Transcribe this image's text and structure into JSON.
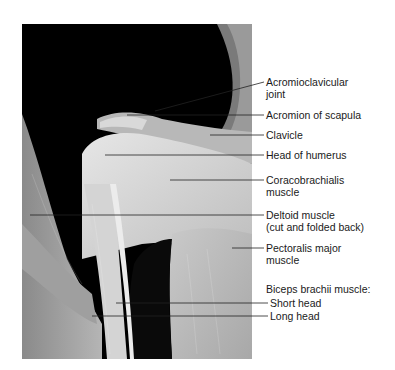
{
  "figure": {
    "labels": [
      {
        "id": "ac-joint",
        "line1": "Acromioclavicular",
        "line2": "joint"
      },
      {
        "id": "acromion",
        "line1": "Acromion of scapula"
      },
      {
        "id": "clavicle",
        "line1": "Clavicle"
      },
      {
        "id": "humeral-head",
        "line1": "Head of humerus"
      },
      {
        "id": "coracobrachialis",
        "line1": "Coracobrachialis",
        "line2": "muscle"
      },
      {
        "id": "deltoid",
        "line1": "Deltoid muscle",
        "line2": "(cut and folded back)"
      },
      {
        "id": "pectoralis",
        "line1": "Pectoralis major",
        "line2": "muscle"
      },
      {
        "id": "biceps-heading",
        "line1": "Biceps brachii muscle:"
      },
      {
        "id": "short-head",
        "line1": "Short head"
      },
      {
        "id": "long-head",
        "line1": "Long head"
      }
    ]
  },
  "colors": {
    "background": "#ffffff",
    "leader_line": "#222222",
    "label_text": "#1a1a1a"
  }
}
